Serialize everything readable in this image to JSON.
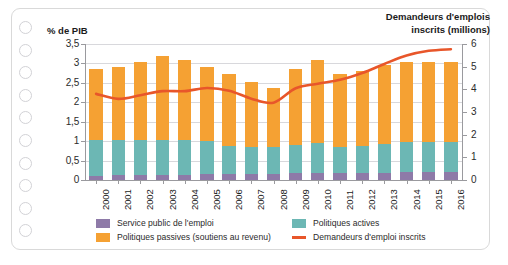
{
  "axis_titles": {
    "left": "% de PIB",
    "right_line1": "Demandeurs d'emplois",
    "right_line2": "inscrits (millions)"
  },
  "legend": [
    {
      "key": "service_public",
      "label": "Service public de l'emploi",
      "color": "#8e7aa8",
      "type": "swatch"
    },
    {
      "key": "politiques_passives",
      "label": "Politiques passives (soutiens au revenu)",
      "color": "#f5a133",
      "type": "swatch"
    },
    {
      "key": "politiques_actives",
      "label": "Politiques actives",
      "color": "#6cb7b4",
      "type": "swatch"
    },
    {
      "key": "demandeurs",
      "label": "Demandeurs d'emploi inscrits",
      "color": "#e8562a",
      "type": "line"
    }
  ],
  "y_left_ticks": [
    "0",
    "0,5",
    "1",
    "1,5",
    "2",
    "2,5",
    "3",
    "3,5"
  ],
  "y_right_ticks": [
    "0",
    "1",
    "2",
    "3",
    "4",
    "5",
    "6"
  ],
  "chart_data": {
    "type": "bar",
    "title": "",
    "subtitle": "",
    "xlabel": "",
    "ylabel": "% de PIB",
    "y2label": "Demandeurs d'emplois inscrits (millions)",
    "ylim": [
      0,
      3.5
    ],
    "y2lim": [
      0,
      6
    ],
    "grid": true,
    "legend_position": "bottom",
    "categories": [
      "2000",
      "2001",
      "2002",
      "2003",
      "2004",
      "2005",
      "2006",
      "2007",
      "2008",
      "2009",
      "2010",
      "2011",
      "2012",
      "2013",
      "2014",
      "2015",
      "2016"
    ],
    "series": [
      {
        "name": "Service public de l'emploi",
        "color": "#8e7aa8",
        "axis": "left",
        "stacked": true,
        "values": [
          0.11,
          0.12,
          0.12,
          0.13,
          0.14,
          0.16,
          0.15,
          0.15,
          0.16,
          0.17,
          0.19,
          0.18,
          0.18,
          0.19,
          0.2,
          0.2,
          0.2
        ]
      },
      {
        "name": "Politiques actives",
        "color": "#6cb7b4",
        "axis": "left",
        "stacked": true,
        "values": [
          0.93,
          0.92,
          0.9,
          0.9,
          0.88,
          0.84,
          0.72,
          0.7,
          0.7,
          0.72,
          0.75,
          0.68,
          0.7,
          0.74,
          0.78,
          0.77,
          0.77
        ]
      },
      {
        "name": "Politiques passives (soutiens au revenu)",
        "color": "#f5a133",
        "axis": "left",
        "stacked": true,
        "values": [
          1.83,
          1.86,
          2.03,
          2.16,
          2.08,
          1.91,
          1.85,
          1.67,
          1.52,
          1.96,
          2.16,
          1.88,
          1.92,
          2.02,
          2.07,
          2.08,
          2.08
        ]
      },
      {
        "name": "Demandeurs d'emploi inscrits",
        "color": "#e8562a",
        "axis": "right",
        "type": "line",
        "values": [
          3.8,
          3.58,
          3.74,
          3.92,
          3.92,
          4.06,
          3.94,
          3.59,
          3.41,
          4.05,
          4.25,
          4.42,
          4.72,
          5.12,
          5.49,
          5.7,
          5.77
        ]
      }
    ],
    "bar_totals": [
      2.87,
      2.9,
      3.05,
      3.19,
      3.1,
      2.91,
      2.72,
      2.52,
      2.38,
      2.85,
      3.1,
      2.74,
      2.8,
      2.95,
      3.05,
      3.05,
      3.05
    ]
  }
}
